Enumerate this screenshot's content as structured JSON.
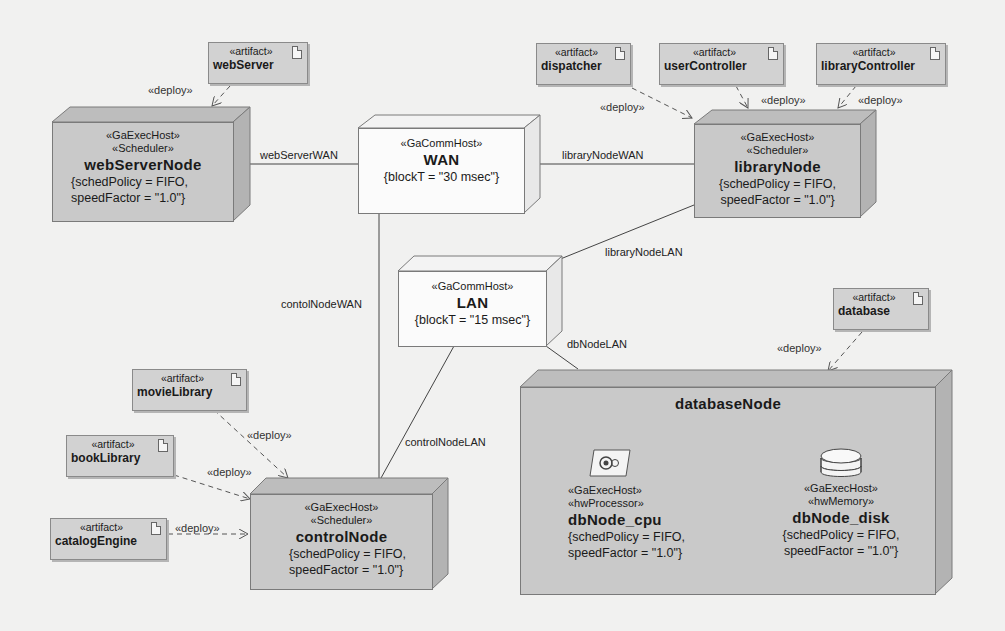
{
  "diagram": {
    "type": "UML deployment diagram (MARTE)",
    "nodes": {
      "webServerNode": {
        "stereotypes": [
          "«GaExecHost»",
          "«Scheduler»"
        ],
        "name": "webServerNode",
        "props": [
          "{schedPolicy = FIFO,",
          "speedFactor = \"1.0\"}"
        ]
      },
      "wan": {
        "stereotypes": [
          "«GaCommHost»"
        ],
        "name": "WAN",
        "props": [
          "{blockT = \"30 msec\"}"
        ]
      },
      "libraryNode": {
        "stereotypes": [
          "«GaExecHost»",
          "«Scheduler»"
        ],
        "name": "libraryNode",
        "props": [
          "{schedPolicy = FIFO,",
          "speedFactor = \"1.0\"}"
        ]
      },
      "lan": {
        "stereotypes": [
          "«GaCommHost»"
        ],
        "name": "LAN",
        "props": [
          "{blockT = \"15 msec\"}"
        ]
      },
      "controlNode": {
        "stereotypes": [
          "«GaExecHost»",
          "«Scheduler»"
        ],
        "name": "controlNode",
        "props": [
          "{schedPolicy = FIFO,",
          "speedFactor = \"1.0\"}"
        ]
      },
      "databaseNode": {
        "name": "databaseNode",
        "parts": [
          {
            "icon": "processor-icon",
            "stereotypes": [
              "«GaExecHost»",
              "«hwProcessor»"
            ],
            "name": "dbNode_cpu",
            "props": [
              "{schedPolicy = FIFO,",
              "speedFactor = \"1.0\"}"
            ]
          },
          {
            "icon": "disk-icon",
            "stereotypes": [
              "«GaExecHost»",
              "«hwMemory»"
            ],
            "name": "dbNode_disk",
            "props": [
              "{schedPolicy = FIFO,",
              "speedFactor = \"1.0\"}"
            ]
          }
        ]
      }
    },
    "artifacts": [
      {
        "stereotype": "«artifact»",
        "name": "webServer"
      },
      {
        "stereotype": "«artifact»",
        "name": "dispatcher"
      },
      {
        "stereotype": "«artifact»",
        "name": "userController"
      },
      {
        "stereotype": "«artifact»",
        "name": "libraryController"
      },
      {
        "stereotype": "«artifact»",
        "name": "database"
      },
      {
        "stereotype": "«artifact»",
        "name": "movieLibrary"
      },
      {
        "stereotype": "«artifact»",
        "name": "bookLibrary"
      },
      {
        "stereotype": "«artifact»",
        "name": "catalogEngine"
      }
    ],
    "links": {
      "webServerWAN": "webServerWAN",
      "libraryNodeWAN": "libraryNodeWAN",
      "libraryNodeLAN": "libraryNodeLAN",
      "contolNodeWAN": "contolNodeWAN",
      "dbNodeLAN": "dbNodeLAN",
      "controlNodeLAN": "controlNodeLAN"
    },
    "deploy_label": "«deploy»",
    "colors": {
      "background": "#f1f1f0",
      "exec_node_fill": "#c9c9c9",
      "comm_node_fill": "#fbfbfb",
      "artifact_fill": "#d2d2d2",
      "line": "#555555"
    }
  }
}
